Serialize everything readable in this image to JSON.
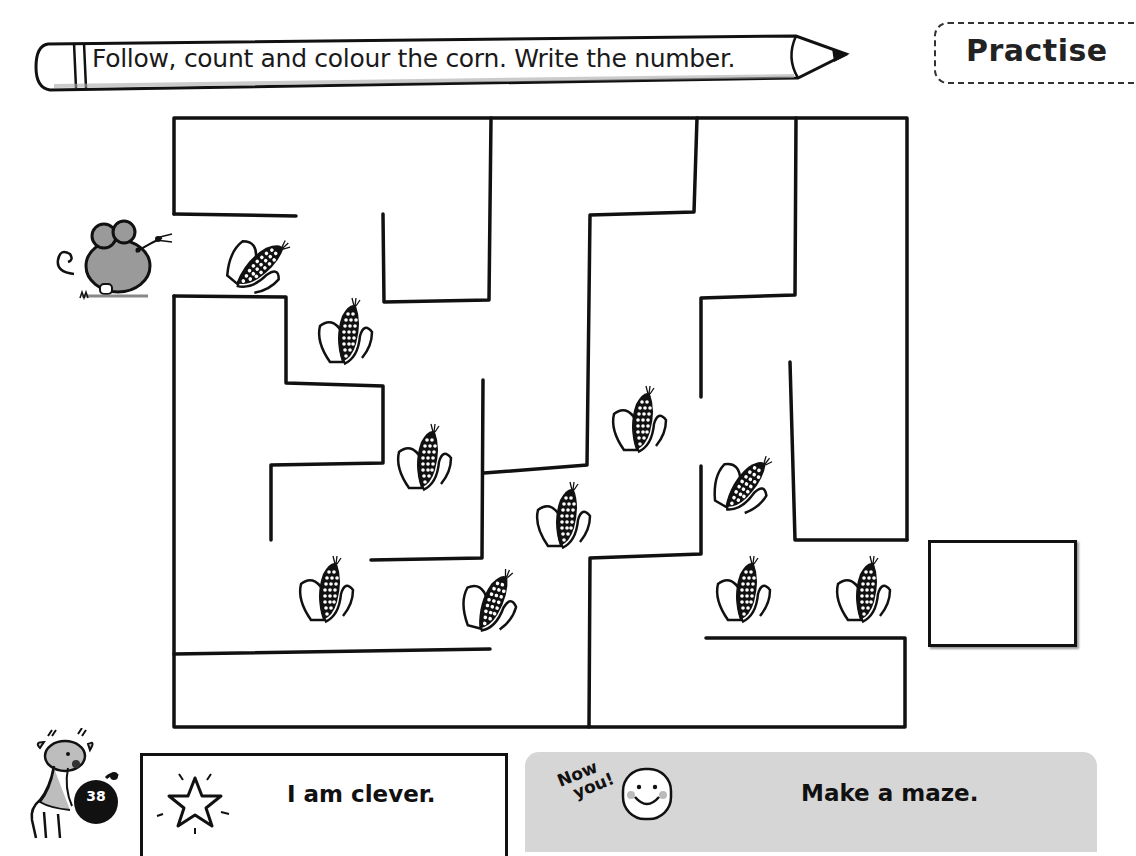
{
  "header": {
    "instruction": "Follow, count and colour the corn. Write the number.",
    "section_tag": "Practise"
  },
  "maze": {
    "start_character": "mouse",
    "item_icon": "corn-icon",
    "corn_count": 11,
    "corn_positions": [
      {
        "x": 225,
        "y": 222,
        "tilt": "diagonal"
      },
      {
        "x": 312,
        "y": 292,
        "tilt": "upright"
      },
      {
        "x": 391,
        "y": 418,
        "tilt": "upright"
      },
      {
        "x": 606,
        "y": 380,
        "tilt": "upright"
      },
      {
        "x": 530,
        "y": 476,
        "tilt": "upright"
      },
      {
        "x": 710,
        "y": 442,
        "tilt": "diagonal"
      },
      {
        "x": 293,
        "y": 550,
        "tilt": "upright"
      },
      {
        "x": 457,
        "y": 560,
        "tilt": "upright"
      },
      {
        "x": 710,
        "y": 550,
        "tilt": "upright"
      },
      {
        "x": 830,
        "y": 550,
        "tilt": "upright"
      }
    ],
    "answer_value": ""
  },
  "footer": {
    "page_number": "38",
    "self_assessment": "I am clever.",
    "now_you_line1": "Now",
    "now_you_line2": "you!",
    "task": "Make a maze."
  },
  "colors": {
    "ink": "#111111",
    "panel_grey": "#d6d6d6",
    "page_bg": "#ffffff"
  }
}
